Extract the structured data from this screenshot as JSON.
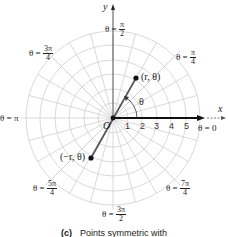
{
  "figure": {
    "caption_label": "(c)",
    "caption_text": "Points symmetric with",
    "axes": {
      "x_label": "x",
      "y_label": "y",
      "origin_label": "O"
    },
    "radial_ticks": [
      "1",
      "2",
      "3",
      "4",
      "5"
    ],
    "angle_labels": {
      "zero": "θ = 0",
      "pi_over_4": {
        "prefix": "θ =",
        "num": "π",
        "den": "4"
      },
      "pi_over_2": {
        "prefix": "θ =",
        "num": "π",
        "den": "2"
      },
      "three_pi_over_4": {
        "prefix": "θ =",
        "num": "3π",
        "den": "4"
      },
      "pi": "θ = π",
      "five_pi_over_4": {
        "prefix": "θ =",
        "num": "5π",
        "den": "4"
      },
      "three_pi_over_2": {
        "prefix": "θ =",
        "num": "3π",
        "den": "2"
      },
      "seven_pi_over_4": {
        "prefix": "θ =",
        "num": "7π",
        "den": "4"
      }
    },
    "points": {
      "p1_label": "(r, θ)",
      "p2_label": "(−r, θ)",
      "angle_label": "θ"
    },
    "colors": {
      "grid": "#c8c8c8",
      "axis": "#111111",
      "segment": "#555555"
    }
  }
}
